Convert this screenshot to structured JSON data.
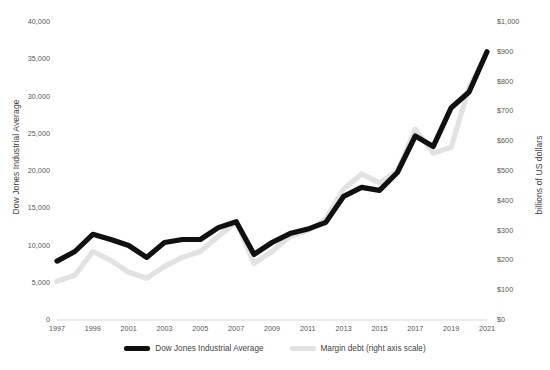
{
  "chart_data": {
    "type": "line",
    "title": "",
    "xlabel": "",
    "ylabel": "Dow Jones Industrial Average",
    "y2label": "billions of US dollars",
    "grid": false,
    "legend_position": "bottom",
    "x": [
      1997,
      1998,
      1999,
      2000,
      2001,
      2002,
      2003,
      2004,
      2005,
      2006,
      2007,
      2008,
      2009,
      2010,
      2011,
      2012,
      2013,
      2014,
      2015,
      2016,
      2017,
      2018,
      2019,
      2020,
      2021
    ],
    "xticks": [
      "1997",
      "1999",
      "2001",
      "2003",
      "2005",
      "2007",
      "2009",
      "2011",
      "2013",
      "2015",
      "2017",
      "2019",
      "2021"
    ],
    "ylim": [
      0,
      40000
    ],
    "yticks": [
      "0",
      "5,000",
      "10,000",
      "15,000",
      "20,000",
      "25,000",
      "30,000",
      "35,000",
      "40,000"
    ],
    "y2lim": [
      0,
      1000
    ],
    "y2ticks": [
      "$0",
      "$100",
      "$200",
      "$300",
      "$400",
      "$500",
      "$600",
      "$700",
      "$800",
      "$900",
      "$1,000"
    ],
    "series": [
      {
        "name": "Dow Jones Industrial Average",
        "axis": "left",
        "color": "#101010",
        "values": [
          7900,
          9200,
          11500,
          10800,
          10000,
          8400,
          10400,
          10800,
          10800,
          12400,
          13200,
          8800,
          10400,
          11600,
          12200,
          13100,
          16600,
          17800,
          17400,
          19800,
          24700,
          23300,
          28500,
          30600,
          36000
        ]
      },
      {
        "name": "Margin debt (right axis scale)",
        "axis": "right",
        "color": "#e2e2e2",
        "values": [
          130,
          150,
          230,
          200,
          160,
          140,
          180,
          210,
          230,
          280,
          330,
          190,
          230,
          280,
          300,
          340,
          440,
          490,
          460,
          500,
          640,
          560,
          580,
          780,
          900
        ]
      }
    ]
  },
  "legend": {
    "items": [
      {
        "label": "Dow Jones Industrial Average",
        "color": "#101010"
      },
      {
        "label": "Margin debt (right axis scale)",
        "color": "#e2e2e2"
      }
    ]
  }
}
